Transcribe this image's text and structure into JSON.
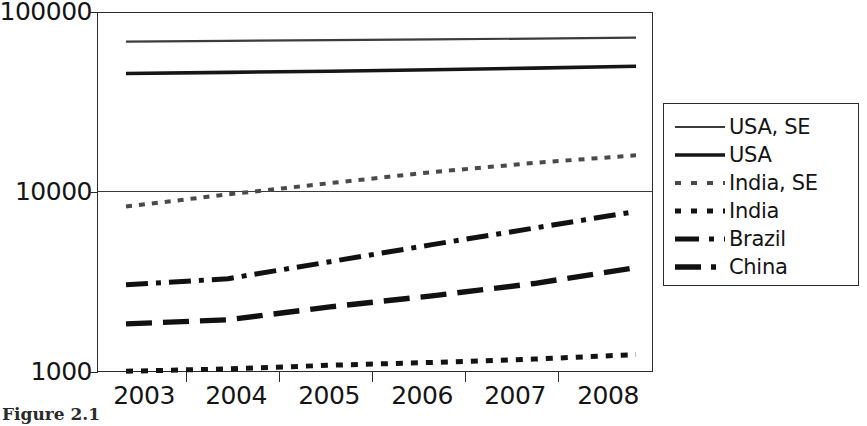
{
  "chart_data": {
    "type": "line",
    "title": "",
    "xlabel": "",
    "ylabel": "",
    "yscale": "log",
    "ylim": [
      1000,
      100000
    ],
    "ytick_labels": [
      "100000",
      "10000",
      "1000"
    ],
    "ytick_values": [
      100000,
      10000,
      1000
    ],
    "categories": [
      "2003",
      "2004",
      "2005",
      "2006",
      "2007",
      "2008"
    ],
    "x": [
      2003,
      2004,
      2005,
      2006,
      2007,
      2008
    ],
    "grid": "horizontal-major",
    "legend_position": "right",
    "series": [
      {
        "name": "USA, SE",
        "style": "solid-thin",
        "values": [
          68500,
          69200,
          69800,
          70400,
          71200,
          72000
        ]
      },
      {
        "name": "USA",
        "style": "solid-thick",
        "values": [
          45500,
          46200,
          46900,
          47800,
          48800,
          50000
        ]
      },
      {
        "name": "India, SE",
        "style": "dotted-thin",
        "values": [
          8300,
          9700,
          11200,
          12900,
          14500,
          16000
        ]
      },
      {
        "name": "India",
        "style": "dotted-thick",
        "values": [
          1010,
          1040,
          1090,
          1130,
          1180,
          1250
        ]
      },
      {
        "name": "Brazil",
        "style": "dash-dot",
        "values": [
          3050,
          3300,
          4100,
          5100,
          6300,
          7800
        ]
      },
      {
        "name": "China",
        "style": "long-dash",
        "values": [
          1850,
          1950,
          2300,
          2650,
          3100,
          3800
        ]
      }
    ]
  },
  "caption": {
    "text": "Figure 2.1"
  }
}
